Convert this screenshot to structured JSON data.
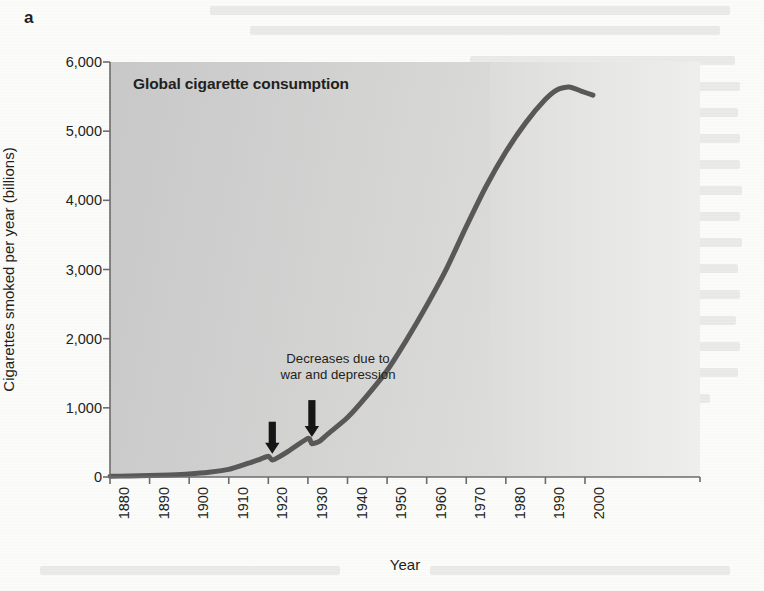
{
  "panel": {
    "label": "a"
  },
  "chart_data": {
    "type": "line",
    "title": "Global cigarette consumption",
    "xlabel": "Year",
    "ylabel": "Cigarettes smoked per year (billions)",
    "xlim": [
      1880,
      2010
    ],
    "ylim": [
      0,
      6000
    ],
    "grid": false,
    "legend": "none",
    "xticks": [
      "1880",
      "1890",
      "1900",
      "1910",
      "1920",
      "1930",
      "1940",
      "1950",
      "1960",
      "1970",
      "1980",
      "1990",
      "2000"
    ],
    "xtick_values": [
      1880,
      1890,
      1900,
      1910,
      1920,
      1930,
      1940,
      1950,
      1960,
      1970,
      1980,
      1990,
      2000
    ],
    "yticks": [
      "0",
      "1,000",
      "2,000",
      "3,000",
      "4,000",
      "5,000",
      "6,000"
    ],
    "ytick_values": [
      0,
      1000,
      2000,
      3000,
      4000,
      5000,
      6000
    ],
    "series": [
      {
        "name": "Global cigarette consumption",
        "color": "#595757",
        "x": [
          1880,
          1885,
          1890,
          1895,
          1900,
          1905,
          1910,
          1915,
          1918,
          1920,
          1921,
          1923,
          1925,
          1930,
          1931,
          1933,
          1935,
          1940,
          1945,
          1950,
          1955,
          1960,
          1965,
          1970,
          1975,
          1980,
          1985,
          1990,
          1993,
          1996,
          1999,
          2002
        ],
        "values": [
          10,
          15,
          20,
          30,
          45,
          70,
          110,
          200,
          260,
          300,
          245,
          300,
          370,
          560,
          480,
          520,
          620,
          860,
          1180,
          1540,
          1990,
          2480,
          3010,
          3620,
          4200,
          4700,
          5120,
          5460,
          5600,
          5640,
          5580,
          5520
        ]
      }
    ],
    "annotations": [
      {
        "text": "Decreases due to\nwar and depression",
        "arrows": [
          {
            "year": 1921,
            "points_to_value": 250
          },
          {
            "year": 1931,
            "points_to_value": 490
          }
        ]
      }
    ],
    "ghost_text_overlay": true
  },
  "colors": {
    "line": "#595757",
    "axis": "#6b6b6b",
    "text": "#231f20",
    "plot_fill_left": "#c8c8c8",
    "plot_fill_right": "#eeeeec",
    "page_background": "#fbfbfa"
  }
}
